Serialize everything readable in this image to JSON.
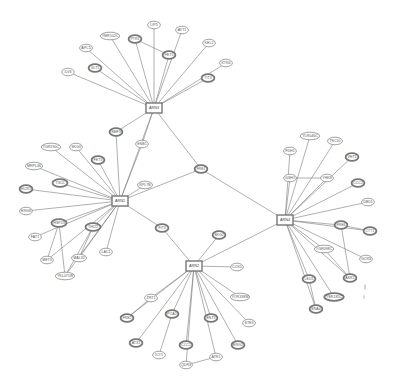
{
  "diagram": {
    "type": "network",
    "hubs": [
      {
        "id": "ARN3",
        "label": "ARN3",
        "x": 154,
        "y": 108
      },
      {
        "id": "ARN1",
        "label": "ARN1",
        "x": 120,
        "y": 201
      },
      {
        "id": "ARN4",
        "label": "ARN4",
        "x": 285,
        "y": 220
      },
      {
        "id": "ARN2",
        "label": "ARN2",
        "x": 194,
        "y": 266
      }
    ],
    "nodes": [
      {
        "id": "ILV3",
        "label": "ILV3",
        "x": 68,
        "y": 72,
        "bold": false
      },
      {
        "id": "APC5",
        "label": "APC5",
        "x": 86,
        "y": 48,
        "bold": false
      },
      {
        "id": "GLT1",
        "label": "GLT1",
        "x": 95,
        "y": 68,
        "bold": true
      },
      {
        "id": "YMR102C",
        "label": "YMR102C",
        "x": 110,
        "y": 36,
        "bold": false
      },
      {
        "id": "PTR1",
        "label": "PTR1",
        "x": 135,
        "y": 39,
        "bold": true
      },
      {
        "id": "LIP5",
        "label": "LIP5",
        "x": 154,
        "y": 25,
        "bold": false
      },
      {
        "id": "AYT1",
        "label": "AYT1",
        "x": 182,
        "y": 30,
        "bold": false
      },
      {
        "id": "FET5",
        "label": "FET5",
        "x": 169,
        "y": 55,
        "bold": true
      },
      {
        "id": "KEL2",
        "label": "KEL2",
        "x": 209,
        "y": 43,
        "bold": false
      },
      {
        "id": "KTR4",
        "label": "KTR4",
        "x": 226,
        "y": 63,
        "bold": false
      },
      {
        "id": "TIT3",
        "label": "TIT3",
        "x": 208,
        "y": 78,
        "bold": true
      },
      {
        "id": "SMF3",
        "label": "SMF3",
        "x": 116,
        "y": 132,
        "bold": true
      },
      {
        "id": "ENB1",
        "label": "ENB1",
        "x": 142,
        "y": 144,
        "bold": false
      },
      {
        "id": "FRE1",
        "label": "FRE1",
        "x": 201,
        "y": 169,
        "bold": true
      },
      {
        "id": "YGR190C",
        "label": "YGR190C",
        "x": 51,
        "y": 147,
        "bold": false
      },
      {
        "id": "SKG3",
        "label": "SKG3",
        "x": 76,
        "y": 147,
        "bold": false
      },
      {
        "id": "FET3",
        "label": "FET3",
        "x": 98,
        "y": 160,
        "bold": true
      },
      {
        "id": "MRPL36",
        "label": "MRPL36",
        "x": 34,
        "y": 166,
        "bold": false
      },
      {
        "id": "TIS11",
        "label": "TIS11",
        "x": 60,
        "y": 183,
        "bold": true
      },
      {
        "id": "HCR1",
        "label": "HCR1",
        "x": 26,
        "y": 189,
        "bold": true
      },
      {
        "id": "RPL7B",
        "label": "RPL7B",
        "x": 145,
        "y": 185,
        "bold": false
      },
      {
        "id": "ERG8",
        "label": "ERG8",
        "x": 26,
        "y": 211,
        "bold": false
      },
      {
        "id": "HSP23",
        "label": "HSP23",
        "x": 59,
        "y": 223,
        "bold": true
      },
      {
        "id": "FAT1",
        "label": "FAT1",
        "x": 35,
        "y": 237,
        "bold": false
      },
      {
        "id": "THI22",
        "label": "THI22",
        "x": 93,
        "y": 227,
        "bold": true
      },
      {
        "id": "MET3",
        "label": "MET3",
        "x": 47,
        "y": 260,
        "bold": false
      },
      {
        "id": "MAL32",
        "label": "MAL32",
        "x": 79,
        "y": 258,
        "bold": false
      },
      {
        "id": "LAC1",
        "label": "LAC1",
        "x": 106,
        "y": 252,
        "bold": false
      },
      {
        "id": "YKL071W",
        "label": "YKL071W",
        "x": 65,
        "y": 276,
        "bold": false
      },
      {
        "id": "FIT3",
        "label": "FIT3",
        "x": 162,
        "y": 228,
        "bold": true
      },
      {
        "id": "SKG2",
        "label": "SKG2",
        "x": 219,
        "y": 235,
        "bold": true
      },
      {
        "id": "COX5",
        "label": "COX5",
        "x": 237,
        "y": 267,
        "bold": false
      },
      {
        "id": "ZRT1",
        "label": "ZRT1",
        "x": 151,
        "y": 298,
        "bold": false
      },
      {
        "id": "YOR338W",
        "label": "YOR338W",
        "x": 240,
        "y": 297,
        "bold": false
      },
      {
        "id": "FRE2",
        "label": "FRE2",
        "x": 127,
        "y": 318,
        "bold": true
      },
      {
        "id": "PCA1",
        "label": "PCA1",
        "x": 172,
        "y": 314,
        "bold": true
      },
      {
        "id": "ENT3",
        "label": "ENT3",
        "x": 211,
        "y": 318,
        "bold": true
      },
      {
        "id": "STE3",
        "label": "STE3",
        "x": 249,
        "y": 323,
        "bold": false
      },
      {
        "id": "ATX1",
        "label": "ATX1",
        "x": 136,
        "y": 343,
        "bold": true
      },
      {
        "id": "CCC1",
        "label": "CCC1",
        "x": 186,
        "y": 345,
        "bold": true
      },
      {
        "id": "ERG2",
        "label": "ERG2",
        "x": 238,
        "y": 345,
        "bold": true
      },
      {
        "id": "ICY1",
        "label": "ICY1",
        "x": 159,
        "y": 355,
        "bold": false
      },
      {
        "id": "ATR1",
        "label": "ATR1",
        "x": 216,
        "y": 357,
        "bold": false
      },
      {
        "id": "QDR3",
        "label": "QDR3",
        "x": 186,
        "y": 365,
        "bold": false
      },
      {
        "id": "YLR046C",
        "label": "YLR046C",
        "x": 310,
        "y": 136,
        "bold": false
      },
      {
        "id": "TSC10",
        "label": "TSC10",
        "x": 335,
        "y": 141,
        "bold": false
      },
      {
        "id": "FDH1",
        "label": "FDH1",
        "x": 290,
        "y": 151,
        "bold": false
      },
      {
        "id": "VHT1",
        "label": "VHT1",
        "x": 352,
        "y": 157,
        "bold": true
      },
      {
        "id": "GSH1",
        "label": "GSH1",
        "x": 290,
        "y": 178,
        "bold": false
      },
      {
        "id": "YHK8",
        "label": "YHK8",
        "x": 327,
        "y": 178,
        "bold": false
      },
      {
        "id": "CCC2",
        "label": "CCC2",
        "x": 358,
        "y": 183,
        "bold": true
      },
      {
        "id": "DBD1",
        "label": "DBD1",
        "x": 368,
        "y": 202,
        "bold": false
      },
      {
        "id": "FRE6",
        "label": "FRE6",
        "x": 341,
        "y": 225,
        "bold": true
      },
      {
        "id": "CTT1",
        "label": "CTT1",
        "x": 370,
        "y": 231,
        "bold": true
      },
      {
        "id": "YGR098C",
        "label": "YGR098C",
        "x": 324,
        "y": 249,
        "bold": false
      },
      {
        "id": "GCR3",
        "label": "GCR3",
        "x": 366,
        "y": 259,
        "bold": false
      },
      {
        "id": "LEU1",
        "label": "LEU1",
        "x": 309,
        "y": 279,
        "bold": true
      },
      {
        "id": "AKR1",
        "label": "AKR1",
        "x": 350,
        "y": 278,
        "bold": true
      },
      {
        "id": "YER185C",
        "label": "YER185C",
        "x": 334,
        "y": 297,
        "bold": true
      },
      {
        "id": "BNA4",
        "label": "BNA4",
        "x": 316,
        "y": 309,
        "bold": true
      }
    ],
    "edges": [
      [
        "ARN3",
        "ILV3"
      ],
      [
        "ARN3",
        "APC5"
      ],
      [
        "ARN3",
        "GLT1"
      ],
      [
        "ARN3",
        "YMR102C"
      ],
      [
        "ARN3",
        "PTR1"
      ],
      [
        "ARN3",
        "LIP5"
      ],
      [
        "ARN3",
        "AYT1"
      ],
      [
        "ARN3",
        "FET5"
      ],
      [
        "ARN3",
        "KEL2"
      ],
      [
        "ARN3",
        "KTR4"
      ],
      [
        "ARN3",
        "TIT3"
      ],
      [
        "PTR1",
        "FET5"
      ],
      [
        "ARN3",
        "SMF3"
      ],
      [
        "ARN3",
        "ENB1"
      ],
      [
        "ARN3",
        "FRE1"
      ],
      [
        "ARN3",
        "ARN1"
      ],
      [
        "ARN1",
        "SMF3"
      ],
      [
        "ARN1",
        "ENB1"
      ],
      [
        "ARN1",
        "FRE1"
      ],
      [
        "ARN1",
        "RPL7B"
      ],
      [
        "ARN1",
        "YGR190C"
      ],
      [
        "ARN1",
        "SKG3"
      ],
      [
        "ARN1",
        "FET3"
      ],
      [
        "ARN1",
        "MRPL36"
      ],
      [
        "ARN1",
        "TIS11"
      ],
      [
        "ARN1",
        "HCR1"
      ],
      [
        "ARN1",
        "ERG8"
      ],
      [
        "ARN1",
        "HSP23"
      ],
      [
        "ARN1",
        "FAT1"
      ],
      [
        "ARN1",
        "THI22"
      ],
      [
        "ARN1",
        "MET3"
      ],
      [
        "ARN1",
        "MAL32"
      ],
      [
        "ARN1",
        "LAC1"
      ],
      [
        "ARN1",
        "YKL071W"
      ],
      [
        "ARN1",
        "FIT3"
      ],
      [
        "HSP23",
        "MET3"
      ],
      [
        "HSP23",
        "YKL071W"
      ],
      [
        "THI22",
        "MAL32"
      ],
      [
        "THI22",
        "YKL071W"
      ],
      [
        "FRE1",
        "ARN4"
      ],
      [
        "ARN2",
        "FIT3"
      ],
      [
        "ARN2",
        "SKG2"
      ],
      [
        "ARN2",
        "COX5"
      ],
      [
        "ARN2",
        "ARN4"
      ],
      [
        "ARN2",
        "ZRT1"
      ],
      [
        "ARN2",
        "YOR338W"
      ],
      [
        "ARN2",
        "FRE2"
      ],
      [
        "ARN2",
        "PCA1"
      ],
      [
        "ARN2",
        "ENT3"
      ],
      [
        "ARN2",
        "STE3"
      ],
      [
        "ARN2",
        "ATX1"
      ],
      [
        "ARN2",
        "CCC1"
      ],
      [
        "ARN2",
        "ERG2"
      ],
      [
        "ARN2",
        "ATR1"
      ],
      [
        "ARN2",
        "QDR3"
      ],
      [
        "ZRT1",
        "FRE2"
      ],
      [
        "PCA1",
        "ICY1"
      ],
      [
        "QDR3",
        "ATR1"
      ],
      [
        "ARN4",
        "YLR046C"
      ],
      [
        "ARN4",
        "TSC10"
      ],
      [
        "ARN4",
        "FDH1"
      ],
      [
        "ARN4",
        "VHT1"
      ],
      [
        "ARN4",
        "GSH1"
      ],
      [
        "ARN4",
        "YHK8"
      ],
      [
        "ARN4",
        "CCC2"
      ],
      [
        "ARN4",
        "DBD1"
      ],
      [
        "ARN4",
        "FRE6"
      ],
      [
        "ARN4",
        "CTT1"
      ],
      [
        "ARN4",
        "YGR098C"
      ],
      [
        "ARN4",
        "GCR3"
      ],
      [
        "ARN4",
        "LEU1"
      ],
      [
        "ARN4",
        "AKR1"
      ],
      [
        "ARN4",
        "YER185C"
      ],
      [
        "ARN4",
        "BNA4"
      ],
      [
        "GSH1",
        "YHK8"
      ],
      [
        "FRE6",
        "CTT1"
      ],
      [
        "FRE6",
        "AKR1"
      ],
      [
        "YGR098C",
        "AKR1"
      ],
      [
        "LEU1",
        "BNA4"
      ]
    ]
  }
}
